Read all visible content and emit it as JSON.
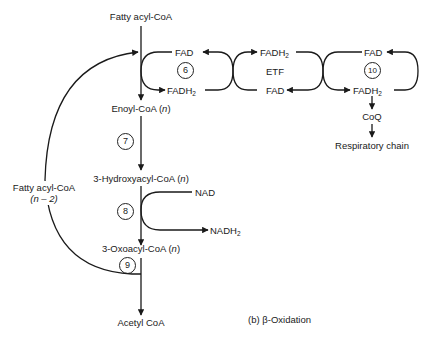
{
  "diagram": {
    "caption": "(b) β-Oxidation",
    "main_pathway": {
      "start": "Fatty acyl-CoA",
      "enoyl": "Enoyl-CoA",
      "hydroxy": "3-Hydroxyacyl-CoA",
      "oxo": "3-Oxoacyl-CoA",
      "end": "Acetyl CoA",
      "n_suffix": "n"
    },
    "recycle": {
      "label_line1": "Fatty acyl-CoA",
      "label_line2": "(n – 2)"
    },
    "steps": {
      "s6": "6",
      "s7": "7",
      "s8": "8",
      "s9": "9",
      "s10": "10"
    },
    "cofactors": {
      "fad": "FAD",
      "fadh": "FADH",
      "sub2": "2",
      "etf": "ETF",
      "nad": "NAD",
      "nadh": "NADH",
      "coq": "CoQ",
      "respiratory": "Respiratory chain"
    },
    "colors": {
      "line": "#1a1a1a",
      "background": "#ffffff"
    }
  }
}
